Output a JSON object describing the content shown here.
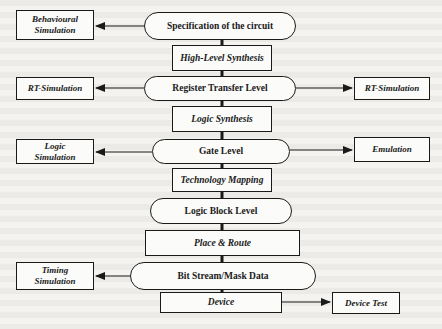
{
  "diagram": {
    "main_flow": [
      {
        "id": "spec",
        "label": "Specification of the circuit",
        "shape": "rounded"
      },
      {
        "id": "hls",
        "label": "High-Level Synthesis",
        "shape": "rect"
      },
      {
        "id": "rtl",
        "label": "Register Transfer Level",
        "shape": "rounded"
      },
      {
        "id": "ls",
        "label": "Logic Synthesis",
        "shape": "rect"
      },
      {
        "id": "gate",
        "label": "Gate Level",
        "shape": "rounded"
      },
      {
        "id": "tm",
        "label": "Technology Mapping",
        "shape": "rect"
      },
      {
        "id": "lbl",
        "label": "Logic Block Level",
        "shape": "rounded"
      },
      {
        "id": "pr",
        "label": "Place & Route",
        "shape": "rect"
      },
      {
        "id": "bs",
        "label": "Bit Stream/Mask Data",
        "shape": "rounded"
      },
      {
        "id": "dev",
        "label": "Device",
        "shape": "rect"
      }
    ],
    "side_nodes": [
      {
        "id": "behav",
        "label_line1": "Behavioural",
        "label_line2": "Simulation",
        "side": "left",
        "from": "spec"
      },
      {
        "id": "rtsim_l",
        "label": "RT-Simulation",
        "side": "left",
        "from": "rtl"
      },
      {
        "id": "rtsim_r",
        "label": "RT-Simulation",
        "side": "right",
        "from": "rtl"
      },
      {
        "id": "logicsim",
        "label_line1": "Logic",
        "label_line2": "Simulation",
        "side": "left",
        "from": "gate"
      },
      {
        "id": "emul",
        "label": "Emulation",
        "side": "right",
        "from": "gate"
      },
      {
        "id": "timing",
        "label_line1": "Timing",
        "label_line2": "Simulation",
        "side": "left",
        "from": "bs"
      },
      {
        "id": "devtest",
        "label": "Device Test",
        "side": "right",
        "from": "dev"
      }
    ],
    "colors": {
      "stroke": "#1a1a1a",
      "background": "#f4f3ef",
      "node_fill": "#fbfbf9"
    }
  }
}
